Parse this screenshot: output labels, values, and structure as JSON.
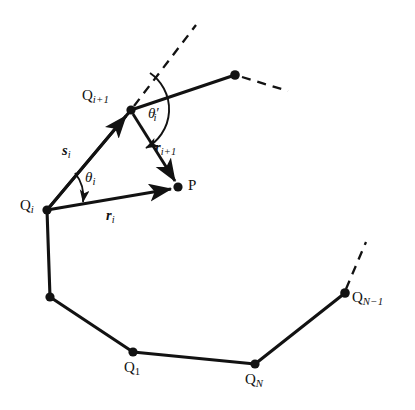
{
  "figure": {
    "background_color": "#ffffff",
    "stroke_color": "#121212",
    "node_color": "#121212",
    "width": 415,
    "height": 410
  },
  "labels": {
    "q_i": "Q",
    "q_i_sub": "i",
    "q_i1": "Q",
    "q_i1_sub": "i+1",
    "q_1": "Q",
    "q_1_sub": "1",
    "q_n": "Q",
    "q_n_sub": "N",
    "q_nm1": "Q",
    "q_nm1_sub": "N−1",
    "point_p": "P",
    "vec_s_i": "s",
    "vec_s_i_sub": "i",
    "vec_r_i": "r",
    "vec_r_i_sub": "i",
    "vec_r_i1": "r",
    "vec_r_i1_sub": "i+1",
    "theta_i": "θ",
    "theta_i_sub": "i",
    "theta_i_prime": "θ",
    "theta_i_prime_mark": "′",
    "theta_i_prime_sub": "i"
  },
  "geometry": {
    "nodes": [
      {
        "name": "Q_i",
        "x": 47,
        "y": 210
      },
      {
        "name": "Q_i+1",
        "x": 131,
        "y": 110
      },
      {
        "name": "Q_next",
        "x": 235,
        "y": 75
      },
      {
        "name": "Q_vert_b",
        "x": 50,
        "y": 297
      },
      {
        "name": "Q_1",
        "x": 133,
        "y": 352
      },
      {
        "name": "Q_N",
        "x": 255,
        "y": 364
      },
      {
        "name": "Q_N-1",
        "x": 345,
        "y": 293
      },
      {
        "name": "P",
        "x": 178,
        "y": 187
      }
    ],
    "solid_edges": [
      {
        "from": "Q_i",
        "to": "Q_i+1"
      },
      {
        "from": "Q_i+1",
        "to": "Q_next"
      },
      {
        "from": "Q_i",
        "to": "Q_vert_b"
      },
      {
        "from": "Q_vert_b",
        "to": "Q_1"
      },
      {
        "from": "Q_1",
        "to": "Q_N"
      },
      {
        "from": "Q_N",
        "to": "Q_N-1"
      }
    ],
    "vectors": [
      {
        "name": "s_i",
        "from": "Q_i",
        "to": "Q_i+1"
      },
      {
        "name": "r_i",
        "from": "Q_i",
        "to": "P"
      },
      {
        "name": "r_i+1",
        "from": "Q_i+1",
        "to": "P"
      }
    ],
    "dashed_edges": [
      {
        "name": "extension-from-Q_i+1",
        "x1": 131,
        "y1": 110,
        "x2": 196,
        "y2": 25
      },
      {
        "name": "extension-from-Q_next",
        "x1": 241,
        "y1": 77,
        "x2": 288,
        "y2": 91
      },
      {
        "name": "extension-from-Q_N-1",
        "x1": 345,
        "y1": 290,
        "x2": 366,
        "y2": 242
      }
    ],
    "angle_arcs": [
      {
        "name": "theta_i",
        "vertex": "Q_i",
        "radius": 38
      },
      {
        "name": "theta_i_prime",
        "vertex": "Q_i+1",
        "radius": 42
      }
    ]
  },
  "label_positions": {
    "q_i": {
      "x": 20,
      "y": 198
    },
    "q_i1": {
      "x": 82,
      "y": 88
    },
    "q_1": {
      "x": 124,
      "y": 360
    },
    "q_n": {
      "x": 245,
      "y": 372
    },
    "q_nm1": {
      "x": 352,
      "y": 290
    },
    "p": {
      "x": 188,
      "y": 178
    },
    "s_i": {
      "x": 62,
      "y": 143
    },
    "r_i": {
      "x": 106,
      "y": 208
    },
    "r_i1": {
      "x": 155,
      "y": 140
    },
    "theta_i": {
      "x": 85,
      "y": 170
    },
    "theta_ip": {
      "x": 148,
      "y": 106
    }
  }
}
